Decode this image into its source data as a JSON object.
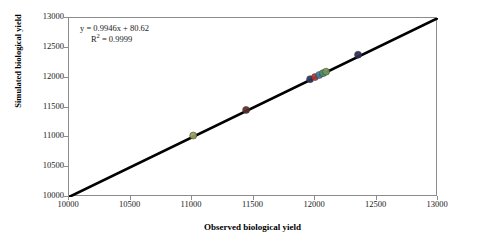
{
  "chart_data": {
    "type": "scatter",
    "title": "",
    "xlabel": "Observed biological yield",
    "ylabel": "Simulated biological yield",
    "xlim": [
      10000,
      13000
    ],
    "ylim": [
      10000,
      13000
    ],
    "xticks": [
      10000,
      10500,
      11000,
      11500,
      12000,
      12500,
      13000
    ],
    "yticks": [
      10000,
      10500,
      11000,
      11500,
      12000,
      12500,
      13000
    ],
    "xtick_labels": [
      "10000",
      "10500",
      "11000",
      "11500",
      "12000",
      "12500",
      "13000"
    ],
    "ytick_labels": [
      "10000",
      "10500",
      "11000",
      "11500",
      "12000",
      "12500",
      "13000"
    ],
    "grid": false,
    "legend": "none",
    "annotations": {
      "equation": "y = 0.9946x + 80.62",
      "r_squared": "R² = 0.9999",
      "r_squared_base": "R",
      "r_squared_sup": "2",
      "r_squared_value": " = 0.9999",
      "slope": 0.9946,
      "intercept": 80.62,
      "r2": 0.9999
    },
    "identity_line": {
      "label": "1:1 line",
      "from": [
        10000,
        10000
      ],
      "to": [
        13000,
        13000
      ],
      "color": "#000000",
      "width": 2.6
    },
    "points": [
      {
        "name": "point-1",
        "x": 11010,
        "y": 11030,
        "color": "#9aa05a"
      },
      {
        "name": "point-2",
        "x": 11440,
        "y": 11460,
        "color": "#5a2a28"
      },
      {
        "name": "point-3",
        "x": 11960,
        "y": 11975,
        "color": "#2b3560"
      },
      {
        "name": "point-4",
        "x": 12000,
        "y": 12010,
        "color": "#b03a34"
      },
      {
        "name": "point-5",
        "x": 12035,
        "y": 12045,
        "color": "#3f7fa8"
      },
      {
        "name": "point-6",
        "x": 12065,
        "y": 12075,
        "color": "#4f8f6a"
      },
      {
        "name": "point-7",
        "x": 12090,
        "y": 12100,
        "color": "#6f9a58"
      },
      {
        "name": "point-8",
        "x": 12350,
        "y": 12385,
        "color": "#2a2a50"
      }
    ],
    "marker": {
      "shape": "circle",
      "size": 7,
      "edge_color": "#333333"
    },
    "colors": {
      "axis": "#8c8c8c",
      "text": "#1a1a1a",
      "line": "#000000",
      "background": "#ffffff"
    }
  }
}
